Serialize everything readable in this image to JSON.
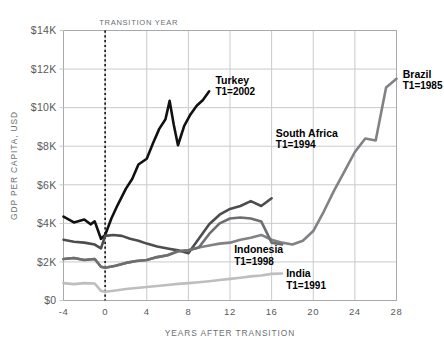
{
  "chart_data": {
    "type": "line",
    "title": "",
    "xlabel": "YEARS AFTER TRANSITION",
    "ylabel": "GDP PER CAPITA, USD",
    "xlim": [
      -4,
      28
    ],
    "ylim": [
      0,
      14000
    ],
    "xticks": [
      "-4",
      "0",
      "4",
      "8",
      "12",
      "16",
      "20",
      "24",
      "28"
    ],
    "xtick_values": [
      -4,
      0,
      4,
      8,
      12,
      16,
      20,
      24,
      28
    ],
    "yticks": [
      "$0",
      "$2K",
      "$4K",
      "$6K",
      "$8K",
      "$10K",
      "$12K",
      "$14K"
    ],
    "ytick_values": [
      0,
      2000,
      4000,
      6000,
      8000,
      10000,
      12000,
      14000
    ],
    "grid": true,
    "legend": "inline-annotations",
    "annotations": [
      {
        "name": "transition-marker",
        "text": "TRANSITION YEAR",
        "x": 0
      }
    ],
    "series": [
      {
        "name": "Turkey",
        "sublabel": "T1=2002",
        "color": "#111111",
        "width": 2.6,
        "label_x": 10.6,
        "label_y": 11250,
        "x": [
          -4,
          -3,
          -2,
          -1.4,
          -1,
          -0.4,
          0,
          0.6,
          1.2,
          2,
          2.6,
          3.2,
          4,
          4.6,
          5.2,
          5.8,
          6.2,
          6.6,
          7,
          7.6,
          8.2,
          8.8,
          9.4,
          10
        ],
        "y": [
          4350,
          4050,
          4200,
          3950,
          4100,
          3200,
          3400,
          4250,
          4950,
          5800,
          6300,
          7050,
          7350,
          8150,
          8900,
          9400,
          10350,
          9100,
          8050,
          9050,
          9650,
          10100,
          10400,
          10850
        ]
      },
      {
        "name": "South Africa",
        "sublabel": "T1=1994",
        "color": "#4d4d4f",
        "width": 2.6,
        "label_x": 16.4,
        "label_y": 8500,
        "x": [
          -4,
          -3,
          -2,
          -1,
          -0.4,
          0,
          0.8,
          1.6,
          2.4,
          3.2,
          4,
          5,
          6,
          7,
          8,
          9,
          10,
          11,
          12,
          13,
          14,
          15,
          16
        ],
        "y": [
          3150,
          3050,
          3000,
          2900,
          2700,
          3350,
          3400,
          3350,
          3200,
          3100,
          2950,
          2800,
          2700,
          2600,
          2450,
          3200,
          3950,
          4450,
          4750,
          4900,
          5150,
          4900,
          5300
        ]
      },
      {
        "name": "Brazil",
        "sublabel": "T1=1985",
        "color": "#808285",
        "width": 2.6,
        "label_x": 28.6,
        "label_y": 11550,
        "x": [
          -4,
          -3,
          -2,
          -1,
          -0.4,
          0,
          1,
          2,
          3,
          4,
          5,
          6,
          7,
          8,
          9,
          10,
          11,
          12,
          13,
          14,
          15,
          16,
          17,
          18,
          19,
          20,
          21,
          22,
          23,
          24,
          25,
          26,
          27,
          28
        ],
        "y": [
          2150,
          2200,
          2100,
          2150,
          1750,
          1700,
          1800,
          1950,
          2050,
          2100,
          2250,
          2350,
          2550,
          2600,
          2750,
          2850,
          2950,
          3000,
          3150,
          3250,
          3400,
          3150,
          3000,
          2900,
          3100,
          3600,
          4600,
          5700,
          6700,
          7700,
          8400,
          8300,
          11050,
          11500
        ]
      },
      {
        "name": "Indonesia",
        "sublabel": "T1=1998",
        "color": "#6d6e70",
        "width": 2.6,
        "label_x": 12.4,
        "label_y": 2450,
        "x": [
          -4,
          -3,
          -2,
          -1,
          -0.4,
          0,
          1,
          2,
          3,
          4,
          5,
          6,
          7,
          8,
          9,
          10,
          11,
          12,
          13,
          14,
          15,
          16,
          17
        ],
        "y": [
          2150,
          2200,
          2100,
          2150,
          1750,
          1700,
          1800,
          1950,
          2050,
          2100,
          2250,
          2350,
          2550,
          2600,
          2750,
          3450,
          4000,
          4250,
          4300,
          4250,
          4100,
          3000,
          2900
        ]
      },
      {
        "name": "India",
        "sublabel": "T1=1991",
        "color": "#bcbec0",
        "width": 2.6,
        "label_x": 17.4,
        "label_y": 1200,
        "x": [
          -4,
          -3,
          -2,
          -1,
          -0.4,
          0,
          1,
          2,
          3,
          4,
          5,
          6,
          7,
          8,
          9,
          10,
          11,
          12,
          13,
          14,
          15,
          16,
          17
        ],
        "y": [
          900,
          850,
          900,
          880,
          500,
          450,
          520,
          600,
          650,
          700,
          750,
          800,
          860,
          900,
          950,
          1000,
          1060,
          1120,
          1180,
          1250,
          1300,
          1380,
          1400
        ]
      }
    ]
  }
}
